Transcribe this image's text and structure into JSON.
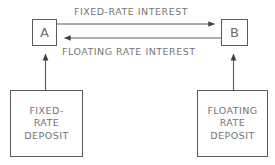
{
  "diagram": {
    "type": "interest-rate-swap-flow-diagram",
    "background_color": "#ffffff",
    "line_color": "#5a5a5a",
    "text_color": "#737373",
    "nodes": {
      "counterparty_a": {
        "label": "A",
        "icon": "rectangle-node-icon"
      },
      "counterparty_b": {
        "label": "B",
        "icon": "rectangle-node-icon"
      },
      "fixed_deposit": {
        "lines": [
          "FIXED-",
          "RATE",
          "DEPOSIT"
        ]
      },
      "floating_deposit": {
        "lines": [
          "FLOATING",
          "RATE",
          "DEPOSIT"
        ]
      }
    },
    "edges": {
      "a_to_b": {
        "label": "FIXED-RATE INTEREST",
        "direction": "A-to-B",
        "arrowhead": "right"
      },
      "b_to_a": {
        "label": "FLOATING RATE INTEREST",
        "direction": "B-to-A",
        "arrowhead": "left"
      },
      "fixed_deposit_to_a": {
        "label": "",
        "direction": "up",
        "arrowhead": "up"
      },
      "floating_deposit_to_b": {
        "label": "",
        "direction": "up",
        "arrowhead": "up"
      }
    }
  }
}
